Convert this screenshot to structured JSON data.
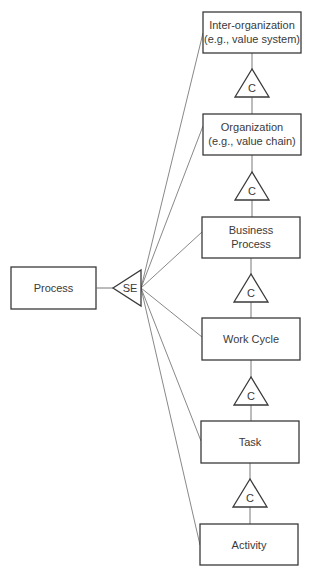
{
  "diagram": {
    "root": {
      "label": "Process",
      "connector": "SE"
    },
    "levels": [
      {
        "lines": [
          "Inter-organization",
          "(e.g., value system)"
        ]
      },
      {
        "lines": [
          "Organization",
          "(e.g., value chain)"
        ]
      },
      {
        "lines": [
          "Business",
          "Process"
        ]
      },
      {
        "lines": [
          "Work Cycle"
        ]
      },
      {
        "lines": [
          "Task"
        ]
      },
      {
        "lines": [
          "Activity"
        ]
      }
    ],
    "composition_connectors": [
      "C",
      "C",
      "C",
      "C",
      "C"
    ],
    "colors": {
      "stroke": "#3a3a3a",
      "line": "#6a6a6a",
      "background": "#ffffff"
    }
  }
}
